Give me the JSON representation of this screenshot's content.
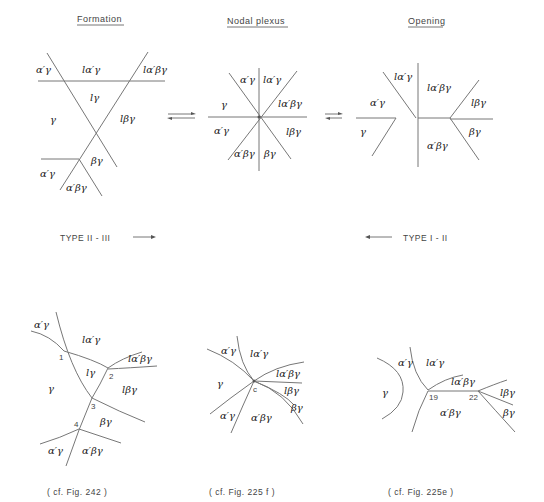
{
  "titles": {
    "formation": "Formation",
    "nodal": "Nodal  plexus",
    "opening": "Opening"
  },
  "types": {
    "left": "TYPE  II - III",
    "right": "TYPE  I - II"
  },
  "top": {
    "formation": [
      "α′γ",
      "lα′γ",
      "lα′βγ",
      "lγ",
      "γ",
      "lβγ",
      "βγ",
      "α′γ",
      "α′βγ"
    ],
    "nodal": [
      "α′γ",
      "lα′γ",
      "γ",
      "lα′βγ",
      "α′γ",
      "lβγ",
      "α′βγ",
      "βγ"
    ],
    "opening": [
      "lα′γ",
      "lα′βγ",
      "α′γ",
      "lβγ",
      "γ",
      "βγ",
      "α′βγ"
    ]
  },
  "bottom": {
    "left": {
      "labels": [
        "α′γ",
        "lα′γ",
        "lα′βγ",
        "lγ",
        "γ",
        "lβγ",
        "βγ",
        "α′γ",
        "α′βγ"
      ],
      "nodes": [
        "1",
        "2",
        "3",
        "4"
      ],
      "caption": "( cf.  Fig. 242 )"
    },
    "middle": {
      "labels": [
        "α′γ",
        "lα′γ",
        "lα′βγ",
        "γ",
        "lβγ",
        "βγ",
        "α′γ",
        "α′βγ"
      ],
      "nodes": [
        "c"
      ],
      "caption": "( cf.   Fig. 225 f )"
    },
    "right": {
      "labels": [
        "α′γ",
        "lα′γ",
        "lα′βγ",
        "γ",
        "lβγ",
        "α′βγ",
        "βγ"
      ],
      "nodes": [
        "19",
        "22"
      ],
      "caption": "( cf.   Fig. 225e )"
    }
  }
}
